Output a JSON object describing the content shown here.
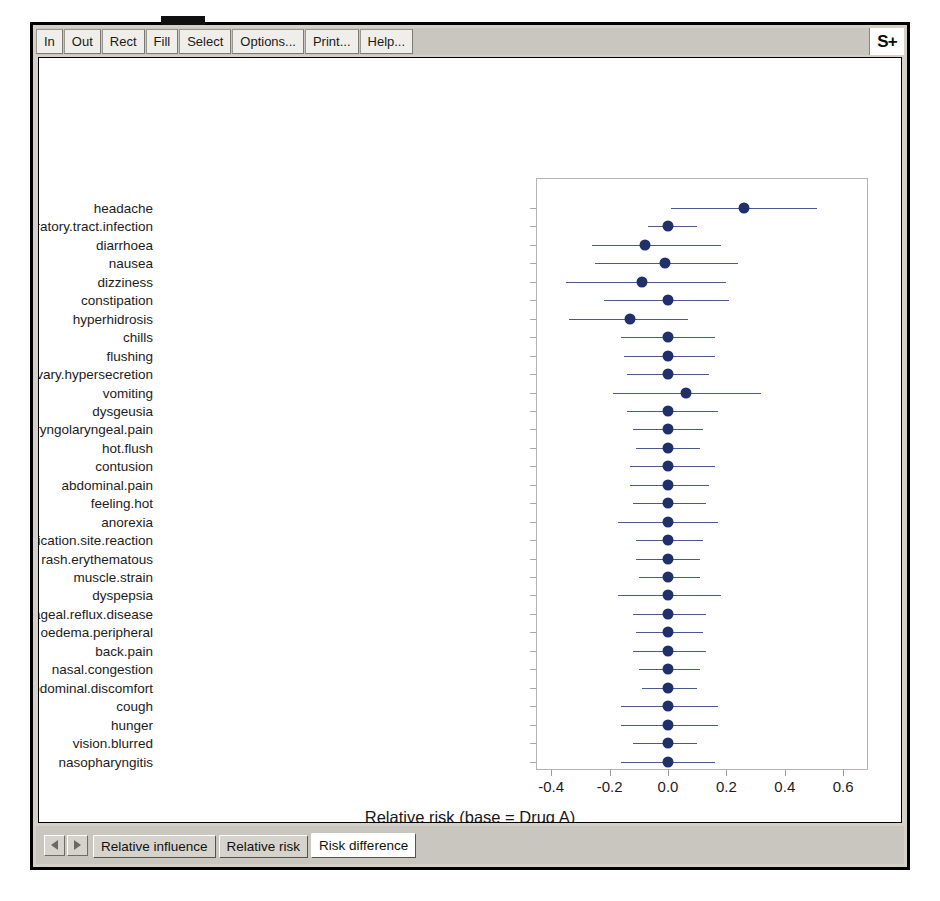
{
  "window": {
    "logo": "S+"
  },
  "toolbar": {
    "buttons": [
      {
        "name": "zoom-in",
        "label": "In"
      },
      {
        "name": "zoom-out",
        "label": "Out"
      },
      {
        "name": "rect",
        "label": "Rect"
      },
      {
        "name": "fill",
        "label": "Fill"
      },
      {
        "name": "select",
        "label": "Select"
      },
      {
        "name": "options",
        "label": "Options..."
      },
      {
        "name": "print",
        "label": "Print..."
      },
      {
        "name": "help",
        "label": "Help..."
      }
    ]
  },
  "tabs": {
    "items": [
      {
        "label": "Relative influence",
        "active": false
      },
      {
        "label": "Relative risk",
        "active": false
      },
      {
        "label": "Risk difference",
        "active": true
      }
    ]
  },
  "chart_data": {
    "type": "scatter",
    "title": "",
    "xlabel": "Relative risk (base = Drug A)",
    "sublabel": "90% interval estimate",
    "ylabel": "",
    "xlim": [
      -0.48,
      0.63
    ],
    "xticks": [
      -0.4,
      -0.2,
      0.0,
      0.2,
      0.4,
      0.6
    ],
    "xticklabels": [
      "-0.4",
      "-0.2",
      "0.0",
      "0.2",
      "0.4",
      "0.6"
    ],
    "grid": false,
    "legend": null,
    "marker_color": "#20306a",
    "interval_color": "#4a5a8c",
    "interval_level": "90%",
    "categories": [
      "headache",
      "upper.respiratory.tract.infection",
      "diarrhoea",
      "nausea",
      "dizziness",
      "constipation",
      "hyperhidrosis",
      "chills",
      "flushing",
      "salivary.hypersecretion",
      "vomiting",
      "dysgeusia",
      "pharyngolaryngeal.pain",
      "hot.flush",
      "contusion",
      "abdominal.pain",
      "feeling.hot",
      "anorexia",
      "application.site.reaction",
      "rash.erythematous",
      "muscle.strain",
      "dyspepsia",
      "gastrooesophageal.reflux.disease",
      "oedema.peripheral",
      "back.pain",
      "nasal.congestion",
      "abdominal.discomfort",
      "cough",
      "hunger",
      "vision.blurred",
      "nasopharyngitis"
    ],
    "estimates": [
      0.26,
      0.0,
      -0.08,
      -0.01,
      -0.09,
      0.0,
      -0.13,
      0.0,
      0.0,
      0.0,
      0.06,
      0.0,
      0.0,
      0.0,
      0.0,
      0.0,
      0.0,
      0.0,
      0.0,
      0.0,
      0.0,
      0.0,
      0.0,
      0.0,
      0.0,
      0.0,
      0.0,
      0.0,
      0.0,
      0.0,
      0.0
    ],
    "lower": [
      0.01,
      -0.07,
      -0.26,
      -0.25,
      -0.35,
      -0.22,
      -0.34,
      -0.16,
      -0.15,
      -0.14,
      -0.19,
      -0.14,
      -0.12,
      -0.11,
      -0.13,
      -0.13,
      -0.12,
      -0.17,
      -0.11,
      -0.11,
      -0.1,
      -0.17,
      -0.12,
      -0.11,
      -0.12,
      -0.1,
      -0.09,
      -0.16,
      -0.16,
      -0.12,
      -0.16
    ],
    "upper": [
      0.51,
      0.1,
      0.18,
      0.24,
      0.2,
      0.21,
      0.07,
      0.16,
      0.16,
      0.14,
      0.32,
      0.17,
      0.12,
      0.11,
      0.16,
      0.14,
      0.13,
      0.17,
      0.12,
      0.11,
      0.11,
      0.18,
      0.13,
      0.12,
      0.13,
      0.11,
      0.1,
      0.17,
      0.17,
      0.1,
      0.16
    ]
  }
}
